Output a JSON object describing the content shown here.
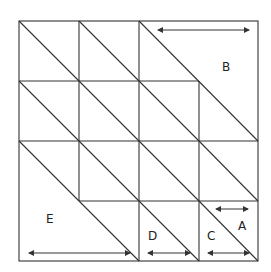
{
  "diagram": {
    "type": "tiled-square-grid",
    "grid": {
      "rows": 4,
      "cols": 4
    },
    "line_color": "#333333",
    "labels": {
      "A": "A",
      "B": "B",
      "C": "C",
      "D": "D",
      "E": "E"
    }
  }
}
